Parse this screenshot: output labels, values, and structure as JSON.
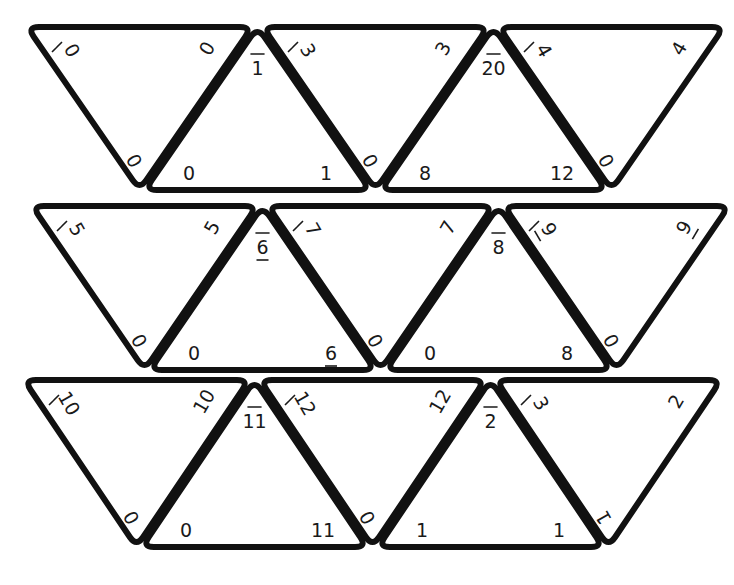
{
  "puzzle": {
    "type": "triangle-tile-matching",
    "rows": 3,
    "tiles_per_row": 5,
    "colors": {
      "outline": "#111111",
      "text": "#1a1a1a",
      "background": "#ffffff"
    }
  },
  "tiles": [
    {
      "row": 1,
      "col": 1,
      "orientation": "down",
      "corners": {
        "top_left": "0",
        "top_right": "0",
        "bottom": "0"
      },
      "marked_corner": "top_left"
    },
    {
      "row": 1,
      "col": 2,
      "orientation": "up",
      "corners": {
        "top": "1",
        "bottom_left": "0",
        "bottom_right": "1"
      },
      "marked_corner": "top"
    },
    {
      "row": 1,
      "col": 3,
      "orientation": "down",
      "corners": {
        "top_left": "3",
        "top_right": "3",
        "bottom": "0"
      },
      "marked_corner": "top_left"
    },
    {
      "row": 1,
      "col": 4,
      "orientation": "up",
      "corners": {
        "top": "20",
        "bottom_left": "8",
        "bottom_right": "12"
      },
      "marked_corner": "top"
    },
    {
      "row": 1,
      "col": 5,
      "orientation": "down",
      "corners": {
        "top_left": "4",
        "top_right": "4",
        "bottom": "0"
      },
      "marked_corner": "top_left"
    },
    {
      "row": 2,
      "col": 1,
      "orientation": "down",
      "corners": {
        "top_left": "5",
        "top_right": "5",
        "bottom": "0"
      },
      "marked_corner": "top_left"
    },
    {
      "row": 2,
      "col": 2,
      "orientation": "up",
      "corners": {
        "top": "6",
        "bottom_left": "0",
        "bottom_right": "6"
      },
      "marked_corner": "top",
      "underlined": [
        "top",
        "bottom_right"
      ]
    },
    {
      "row": 2,
      "col": 3,
      "orientation": "down",
      "corners": {
        "top_left": "7",
        "top_right": "7",
        "bottom": "0"
      },
      "marked_corner": "top_left"
    },
    {
      "row": 2,
      "col": 4,
      "orientation": "up",
      "corners": {
        "top": "8",
        "bottom_left": "0",
        "bottom_right": "8"
      },
      "marked_corner": "top"
    },
    {
      "row": 2,
      "col": 5,
      "orientation": "down",
      "corners": {
        "top_left": "9",
        "top_right": "9",
        "bottom": "0"
      },
      "marked_corner": "top_left",
      "underlined": [
        "top_left",
        "top_right"
      ]
    },
    {
      "row": 3,
      "col": 1,
      "orientation": "down",
      "corners": {
        "top_left": "10",
        "top_right": "10",
        "bottom": "0"
      },
      "marked_corner": "top_left"
    },
    {
      "row": 3,
      "col": 2,
      "orientation": "up",
      "corners": {
        "top": "11",
        "bottom_left": "0",
        "bottom_right": "11"
      },
      "marked_corner": "top"
    },
    {
      "row": 3,
      "col": 3,
      "orientation": "down",
      "corners": {
        "top_left": "12",
        "top_right": "12",
        "bottom": "0"
      },
      "marked_corner": "top_left"
    },
    {
      "row": 3,
      "col": 4,
      "orientation": "up",
      "corners": {
        "top": "2",
        "bottom_left": "1",
        "bottom_right": "1"
      },
      "marked_corner": "top"
    },
    {
      "row": 3,
      "col": 5,
      "orientation": "down",
      "corners": {
        "top_left": "3",
        "top_right": "2",
        "bottom": "1"
      },
      "marked_corner": "top_left"
    }
  ]
}
